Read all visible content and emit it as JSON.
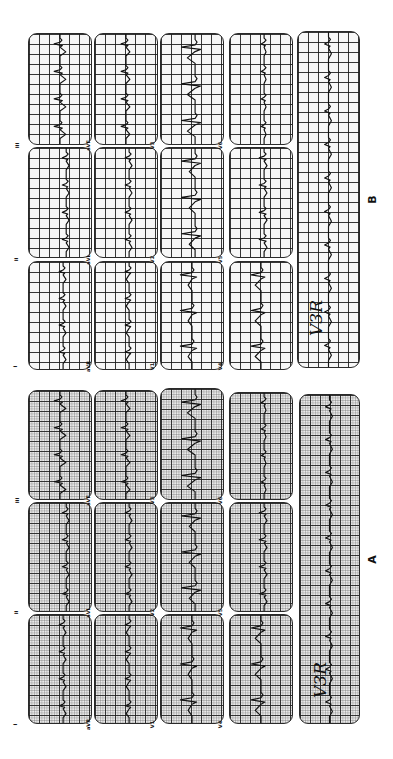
{
  "figure": {
    "orientation": "rotated 90 degrees counter-clockwise",
    "panels": [
      {
        "id": "B",
        "label": "B",
        "label_pos": {
          "x": 372,
          "y": 200
        },
        "grid_style": "light",
        "leads": [
          {
            "name": "I",
            "x": 28,
            "y": 261,
            "w": 64,
            "h": 109,
            "label_pos": {
              "x": 18,
              "y": 366
            }
          },
          {
            "name": "II",
            "x": 28,
            "y": 147,
            "w": 64,
            "h": 111,
            "label_pos": {
              "x": 18,
              "y": 259
            }
          },
          {
            "name": "III",
            "x": 28,
            "y": 33,
            "w": 64,
            "h": 112,
            "label_pos": {
              "x": 18,
              "y": 145
            }
          },
          {
            "name": "aVR",
            "x": 94,
            "y": 261,
            "w": 64,
            "h": 109,
            "label_pos": {
              "x": 86,
              "y": 366
            }
          },
          {
            "name": "aVL",
            "x": 94,
            "y": 147,
            "w": 64,
            "h": 111,
            "label_pos": {
              "x": 86,
              "y": 259
            }
          },
          {
            "name": "aVF",
            "x": 94,
            "y": 33,
            "w": 64,
            "h": 112,
            "label_pos": {
              "x": 86,
              "y": 145
            }
          },
          {
            "name": "V1",
            "x": 160,
            "y": 261,
            "w": 64,
            "h": 109,
            "label_pos": {
              "x": 152,
              "y": 366
            }
          },
          {
            "name": "V2",
            "x": 160,
            "y": 147,
            "w": 64,
            "h": 111,
            "label_pos": {
              "x": 152,
              "y": 259
            }
          },
          {
            "name": "V3",
            "x": 160,
            "y": 33,
            "w": 64,
            "h": 112,
            "label_pos": {
              "x": 152,
              "y": 145
            }
          },
          {
            "name": "V4",
            "x": 229,
            "y": 261,
            "w": 64,
            "h": 109,
            "label_pos": {
              "x": 220,
              "y": 366
            }
          },
          {
            "name": "V5",
            "x": 229,
            "y": 147,
            "w": 64,
            "h": 111,
            "label_pos": {
              "x": 220,
              "y": 259
            }
          },
          {
            "name": "V6",
            "x": 229,
            "y": 33,
            "w": 64,
            "h": 112,
            "label_pos": {
              "x": 220,
              "y": 145
            }
          }
        ],
        "rhythm_strip": {
          "x": 297,
          "y": 31,
          "w": 63,
          "h": 337
        },
        "annotation": {
          "text": "V3R",
          "x": 314,
          "y": 318
        }
      },
      {
        "id": "A",
        "label": "A",
        "label_pos": {
          "x": 372,
          "y": 560
        },
        "grid_style": "dense",
        "leads": [
          {
            "name": "I",
            "x": 28,
            "y": 614,
            "w": 64,
            "h": 110,
            "label_pos": {
              "x": 18,
              "y": 724
            }
          },
          {
            "name": "II",
            "x": 28,
            "y": 502,
            "w": 64,
            "h": 110,
            "label_pos": {
              "x": 18,
              "y": 612
            }
          },
          {
            "name": "III",
            "x": 28,
            "y": 390,
            "w": 64,
            "h": 110,
            "label_pos": {
              "x": 18,
              "y": 500
            }
          },
          {
            "name": "aVR",
            "x": 94,
            "y": 614,
            "w": 64,
            "h": 110,
            "label_pos": {
              "x": 86,
              "y": 724
            }
          },
          {
            "name": "aVL",
            "x": 94,
            "y": 502,
            "w": 64,
            "h": 110,
            "label_pos": {
              "x": 86,
              "y": 612
            }
          },
          {
            "name": "aVF",
            "x": 94,
            "y": 390,
            "w": 64,
            "h": 110,
            "label_pos": {
              "x": 86,
              "y": 500
            }
          },
          {
            "name": "V1",
            "x": 160,
            "y": 614,
            "w": 64,
            "h": 110,
            "label_pos": {
              "x": 152,
              "y": 724
            }
          },
          {
            "name": "V2",
            "x": 160,
            "y": 502,
            "w": 64,
            "h": 110,
            "label_pos": {
              "x": 152,
              "y": 612
            }
          },
          {
            "name": "V3",
            "x": 160,
            "y": 388,
            "w": 64,
            "h": 112,
            "label_pos": {
              "x": 152,
              "y": 500
            }
          },
          {
            "name": "V4",
            "x": 229,
            "y": 614,
            "w": 64,
            "h": 110,
            "label_pos": {
              "x": 220,
              "y": 724
            }
          },
          {
            "name": "V5",
            "x": 229,
            "y": 502,
            "w": 64,
            "h": 110,
            "label_pos": {
              "x": 220,
              "y": 612
            }
          },
          {
            "name": "V6",
            "x": 229,
            "y": 392,
            "w": 64,
            "h": 108,
            "label_pos": {
              "x": 220,
              "y": 500
            }
          }
        ],
        "rhythm_strip": {
          "x": 299,
          "y": 394,
          "w": 61,
          "h": 330
        },
        "annotation": {
          "text": "V3R",
          "x": 318,
          "y": 680
        }
      }
    ]
  }
}
